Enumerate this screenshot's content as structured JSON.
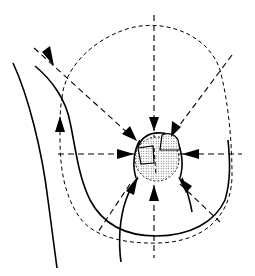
{
  "figure": {
    "type": "line-art anatomical diagram",
    "colors": {
      "ink": "#000000",
      "background": "#ffffff"
    },
    "elements": {
      "outer_body_contour": "solid curved line, left side",
      "breast_contour": "solid curve from upper left sweeping under the breast to the right",
      "breast_dashed_outline": "dashed oval outline around the breast",
      "areola": "stippled circular region at center",
      "nipple_flaps": "two small rectangular flaps on the areola",
      "radial_guides": "dashed lines (vertical, horizontal, diagonals) through center",
      "arrows": {
        "count": 10,
        "directions": [
          "top",
          "upper-left",
          "upper-right",
          "left",
          "right",
          "lower-left",
          "bottom",
          "lower-right",
          "outer-top-left",
          "left-side-up"
        ]
      }
    }
  }
}
